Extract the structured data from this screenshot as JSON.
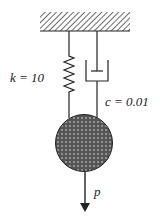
{
  "diagram": {
    "type": "spring-mass-damper",
    "spring": {
      "label": "k = 10"
    },
    "damper": {
      "label": "c = 0.01"
    },
    "force": {
      "label": "p"
    },
    "colors": {
      "line": "#222222",
      "mass_fill": "#555555",
      "hatch": "#444444"
    }
  }
}
